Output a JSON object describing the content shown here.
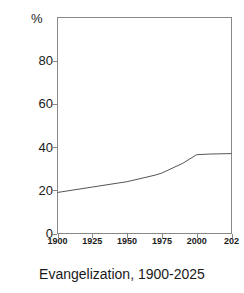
{
  "caption": "Evangelization, 1900-2025",
  "axis": {
    "unit_label": "%",
    "y_ticks": [
      "0",
      "20",
      "40",
      "60",
      "80"
    ],
    "x_ticks": [
      "1900",
      "1925",
      "1950",
      "1975",
      "2000",
      "202"
    ]
  },
  "chart_data": {
    "type": "line",
    "title": "Evangelization, 1900-2025",
    "xlabel": "",
    "ylabel": "%",
    "xlim": [
      1900,
      2025
    ],
    "ylim": [
      0,
      100
    ],
    "grid": false,
    "legend": null,
    "line_color": "#555555",
    "x": [
      1900,
      1925,
      1950,
      1970,
      1975,
      1990,
      2000,
      2010,
      2025
    ],
    "series": [
      {
        "name": "Evangelization",
        "values": [
          19.0,
          21.5,
          24.0,
          27.0,
          28.0,
          32.5,
          36.5,
          36.8,
          37.0
        ]
      }
    ],
    "x_tick_values": [
      1900,
      1925,
      1950,
      1975,
      2000,
      2025
    ],
    "x_tick_labels": [
      "1900",
      "1925",
      "1950",
      "1975",
      "2000",
      "202"
    ],
    "y_tick_values": [
      0,
      20,
      40,
      60,
      80
    ],
    "y_tick_labels": [
      "0",
      "20",
      "40",
      "60",
      "80"
    ]
  }
}
